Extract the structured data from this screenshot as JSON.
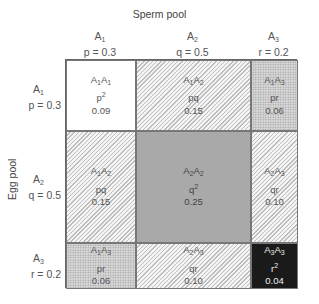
{
  "titles": {
    "top": "Sperm pool",
    "left": "Egg pool"
  },
  "columns": [
    {
      "allele": "A",
      "sub": "1",
      "freq": "p = 0.3"
    },
    {
      "allele": "A",
      "sub": "2",
      "freq": "q = 0.5"
    },
    {
      "allele": "A",
      "sub": "3",
      "freq": "r = 0.2"
    }
  ],
  "rows": [
    {
      "allele": "A",
      "sub": "1",
      "freq": "p = 0.3"
    },
    {
      "allele": "A",
      "sub": "2",
      "freq": "q = 0.5"
    },
    {
      "allele": "A",
      "sub": "3",
      "freq": "r = 0.2"
    }
  ],
  "cells": [
    [
      {
        "g1": "1",
        "g2": "1",
        "expr": "p",
        "exp": "2",
        "value": "0.09",
        "fill": "white"
      },
      {
        "g1": "1",
        "g2": "2",
        "expr": "pq",
        "exp": "",
        "value": "0.15",
        "fill": "hatch"
      },
      {
        "g1": "1",
        "g2": "3",
        "expr": "pr",
        "exp": "",
        "value": "0.06",
        "fill": "dots"
      }
    ],
    [
      {
        "g1": "1",
        "g2": "2",
        "expr": "pq",
        "exp": "",
        "value": "0.15",
        "fill": "hatch"
      },
      {
        "g1": "2",
        "g2": "2",
        "expr": "q",
        "exp": "2",
        "value": "0.25",
        "fill": "gray"
      },
      {
        "g1": "2",
        "g2": "3",
        "expr": "qr",
        "exp": "",
        "value": "0.10",
        "fill": "hatch"
      }
    ],
    [
      {
        "g1": "1",
        "g2": "3",
        "expr": "pr",
        "exp": "",
        "value": "0.06",
        "fill": "dots"
      },
      {
        "g1": "2",
        "g2": "3",
        "expr": "qr",
        "exp": "",
        "value": "0.10",
        "fill": "hatch"
      },
      {
        "g1": "3",
        "g2": "3",
        "expr": "r",
        "exp": "2",
        "value": "0.04",
        "fill": "black"
      }
    ]
  ]
}
